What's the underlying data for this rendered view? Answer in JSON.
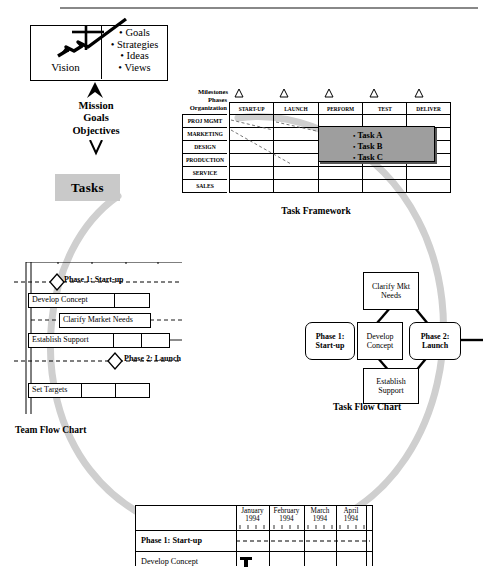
{
  "page": {
    "background": "#ffffff",
    "accent_gray": "#c9c9c9",
    "note_fill": "#9e9e9e"
  },
  "vision": {
    "label": "Vision",
    "icon": "jet-airplane-icon",
    "bullets": [
      "Goals",
      "Strategies",
      "Ideas",
      "Views"
    ]
  },
  "mission": {
    "lines": [
      "Mission",
      "Goals",
      "Objectives"
    ]
  },
  "tasks": {
    "label": "Tasks"
  },
  "task_framework": {
    "caption": "Task Framework",
    "milestones_label": "Milestones",
    "corner_label_top": "Phases",
    "corner_label_bottom": "Organization",
    "columns": [
      "START-UP",
      "LAUNCH",
      "PERFORM",
      "TEST",
      "DELIVER"
    ],
    "rows": [
      "PROJ MGMT",
      "MARKETING",
      "DESIGN",
      "PRODUCTION",
      "SERVICE",
      "SALES"
    ],
    "milestone_markers": 5,
    "note": {
      "items": [
        "Task A",
        "Task B",
        "Task C"
      ]
    }
  },
  "team_flow_chart": {
    "caption": "Team Flow Chart",
    "phases": [
      {
        "label": "Phase 1: Start-up"
      },
      {
        "label": "Phase 2: Launch"
      }
    ],
    "tasks": [
      {
        "label": "Develop Concept"
      },
      {
        "label": "Clarify Market Needs"
      },
      {
        "label": "Establish Support"
      },
      {
        "label": "Set Targets"
      }
    ]
  },
  "task_flow_chart": {
    "caption": "Task Flow Chart",
    "nodes": [
      {
        "label": "Clarify Mkt Needs",
        "shape": "rect"
      },
      {
        "label": "Phase 1: Start-up",
        "shape": "rounded"
      },
      {
        "label": "Develop Concept",
        "shape": "rect"
      },
      {
        "label": "Phase 2: Launch",
        "shape": "rounded"
      },
      {
        "label": "Establish Support",
        "shape": "rect"
      }
    ]
  },
  "gantt": {
    "columns": [
      "January 1994",
      "February 1994",
      "March 1994",
      "April 1994"
    ],
    "rows": [
      {
        "label": "Phase 1: Start-up",
        "type": "milestone"
      },
      {
        "label": "Develop Concept",
        "type": "task"
      }
    ]
  }
}
